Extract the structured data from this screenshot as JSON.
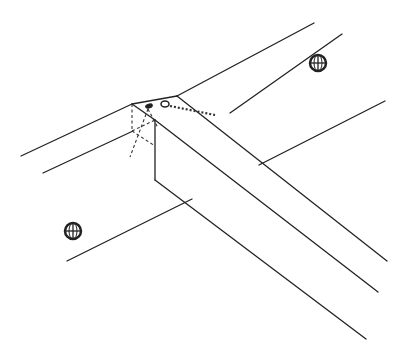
{
  "figure": {
    "type": "technical-line-drawing",
    "width": 404,
    "height": 351,
    "stroke_color": "#222222",
    "background": "#ffffff"
  },
  "elements": {
    "board_lines": [
      {
        "id": "board-top-upper",
        "x1": 21,
        "y1": 156,
        "x2": 314,
        "y2": 23
      },
      {
        "id": "board-top-lower",
        "x1": 43,
        "y1": 173,
        "x2": 342,
        "y2": 34
      },
      {
        "id": "board-right",
        "x1": 259,
        "y1": 165,
        "x2": 385,
        "y2": 101
      },
      {
        "id": "board-left",
        "x1": 67,
        "y1": 261,
        "x2": 192,
        "y2": 199
      }
    ],
    "beam": {
      "top_left_back": [
        132,
        104
      ],
      "top_right_back": [
        177,
        96
      ],
      "front_corner": [
        155,
        120
      ],
      "bottom_front": [
        155,
        180
      ],
      "end_lines": [
        {
          "x1": 177,
          "y1": 96,
          "x2": 387,
          "y2": 261
        },
        {
          "x1": 155,
          "y1": 120,
          "x2": 378,
          "y2": 292
        },
        {
          "x1": 155,
          "y1": 180,
          "x2": 366,
          "y2": 339
        }
      ]
    },
    "knots": [
      {
        "id": "knot-top-right",
        "cx": 318,
        "cy": 63,
        "r": 8
      },
      {
        "id": "knot-bottom-left",
        "cx": 73,
        "cy": 231,
        "r": 8
      }
    ],
    "fasteners": [
      {
        "id": "nail-head",
        "cx": 149,
        "cy": 106
      },
      {
        "id": "screw-hole",
        "cx": 165,
        "cy": 104
      }
    ]
  }
}
